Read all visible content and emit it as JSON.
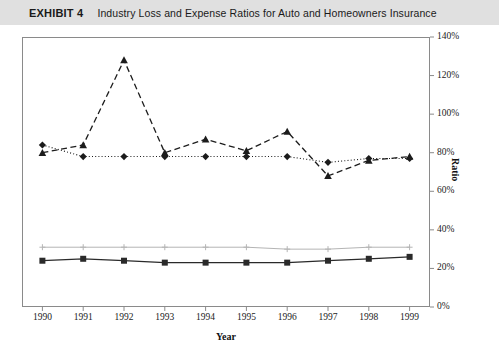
{
  "header": {
    "label": "EXHIBIT 4",
    "title": "Industry Loss and Expense Ratios for Auto and Homeowners Insurance",
    "background": "#e0e0e0"
  },
  "chart_data": {
    "type": "line",
    "title": "Industry Loss and Expense Ratios for Auto and Homeowners Insurance",
    "xlabel": "Year",
    "ylabel": "Ratio",
    "categories": [
      "1990",
      "1991",
      "1992",
      "1993",
      "1994",
      "1995",
      "1996",
      "1997",
      "1998",
      "1999"
    ],
    "x": [
      1990,
      1991,
      1992,
      1993,
      1994,
      1995,
      1996,
      1997,
      1998,
      1999
    ],
    "ylim": [
      0,
      140
    ],
    "yticks": [
      0,
      20,
      40,
      60,
      80,
      100,
      120,
      140
    ],
    "ytick_labels": [
      "0%",
      "20%",
      "40%",
      "60%",
      "80%",
      "100%",
      "120%",
      "140%"
    ],
    "y_axis_position": "right",
    "grid": false,
    "legend": "none",
    "series": [
      {
        "name": "homeowners-loss-ratio",
        "marker": "triangle",
        "linestyle": "dashed",
        "color": "#1c1c1c",
        "values": [
          80,
          84,
          128,
          80,
          87,
          81,
          91,
          68,
          76,
          78
        ]
      },
      {
        "name": "auto-loss-ratio",
        "marker": "diamond",
        "linestyle": "dotted",
        "color": "#1c1c1c",
        "values": [
          84,
          78,
          78,
          78,
          78,
          78,
          78,
          75,
          77,
          77
        ]
      },
      {
        "name": "homeowners-expense-ratio",
        "marker": "plus",
        "linestyle": "solid",
        "color": "#b4b4b4",
        "values": [
          31,
          31,
          31,
          31,
          31,
          31,
          30,
          30,
          31,
          31
        ]
      },
      {
        "name": "auto-expense-ratio",
        "marker": "square",
        "linestyle": "solid",
        "color": "#2a2a2a",
        "values": [
          24,
          25,
          24,
          23,
          23,
          23,
          23,
          24,
          25,
          26
        ]
      }
    ]
  }
}
